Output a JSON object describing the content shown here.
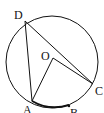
{
  "diagram": {
    "type": "circle-geometry",
    "circle": {
      "center_label": "O",
      "cx": 52,
      "cy": 62,
      "r": 46
    },
    "points": {
      "D": {
        "label": "D",
        "x": 25,
        "y": 21
      },
      "O": {
        "label": "O",
        "x": 53,
        "y": 58
      },
      "C": {
        "label": "C",
        "x": 93,
        "y": 84
      },
      "A": {
        "label": "A",
        "x": 32,
        "y": 101
      },
      "B": {
        "label": "B",
        "x": 69,
        "y": 108
      }
    },
    "segments": [
      "DA",
      "DC",
      "OA",
      "OC"
    ],
    "highlighted_arc": "AB",
    "colors": {
      "stroke": "#111111",
      "background": "#ffffff"
    }
  }
}
